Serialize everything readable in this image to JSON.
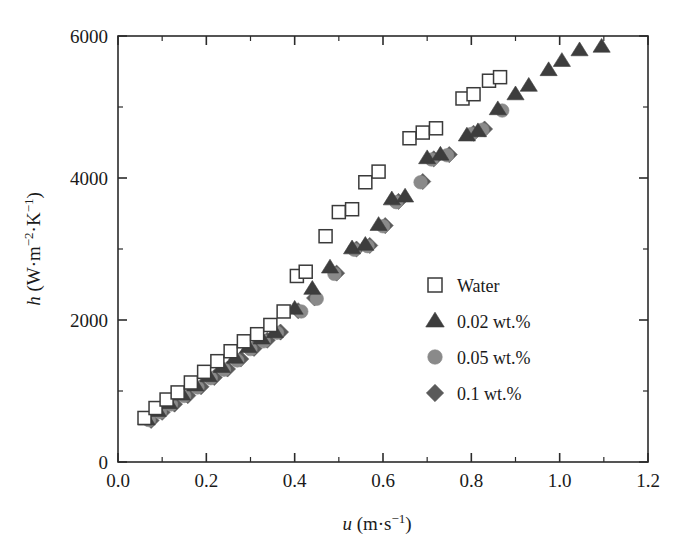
{
  "chart_data": {
    "type": "scatter",
    "title": "",
    "xlabel": "u (m·s−1)",
    "xlabel_symbol": "u",
    "xlabel_units": "(m·s",
    "ylabel": "h (W·m−2·K−1)",
    "ylabel_symbol": "h",
    "xlim": [
      0.0,
      1.2
    ],
    "ylim": [
      0,
      6000
    ],
    "xticks": [
      0.0,
      0.2,
      0.4,
      0.6,
      0.8,
      1.0,
      1.2
    ],
    "xticklabels": [
      "0.0",
      "0.2",
      "0.4",
      "0.6",
      "0.8",
      "1.0",
      "1.2"
    ],
    "xminor_step": 0.1,
    "yticks": [
      0,
      2000,
      4000,
      6000
    ],
    "yticklabels": [
      "0",
      "2000",
      "4000",
      "6000"
    ],
    "yminor_step": 1000,
    "grid": false,
    "legend_position": "center-right",
    "series": [
      {
        "name": "Water",
        "marker": "open-square",
        "fill": "#ffffff",
        "stroke": "#3a3a3a",
        "points": [
          [
            0.06,
            620
          ],
          [
            0.085,
            760
          ],
          [
            0.11,
            880
          ],
          [
            0.135,
            980
          ],
          [
            0.165,
            1120
          ],
          [
            0.195,
            1270
          ],
          [
            0.225,
            1420
          ],
          [
            0.255,
            1560
          ],
          [
            0.285,
            1700
          ],
          [
            0.315,
            1800
          ],
          [
            0.345,
            1930
          ],
          [
            0.375,
            2120
          ],
          [
            0.405,
            2620
          ],
          [
            0.425,
            2680
          ],
          [
            0.47,
            3180
          ],
          [
            0.5,
            3520
          ],
          [
            0.53,
            3560
          ],
          [
            0.56,
            3940
          ],
          [
            0.59,
            4090
          ],
          [
            0.66,
            4560
          ],
          [
            0.69,
            4640
          ],
          [
            0.72,
            4700
          ],
          [
            0.78,
            5120
          ],
          [
            0.805,
            5180
          ],
          [
            0.84,
            5370
          ],
          [
            0.865,
            5420
          ]
        ]
      },
      {
        "name": "0.02 wt.%",
        "marker": "triangle",
        "fill": "#3d3d3d",
        "stroke": "#3d3d3d",
        "points": [
          [
            0.065,
            600
          ],
          [
            0.09,
            720
          ],
          [
            0.115,
            830
          ],
          [
            0.145,
            950
          ],
          [
            0.175,
            1080
          ],
          [
            0.205,
            1210
          ],
          [
            0.235,
            1340
          ],
          [
            0.265,
            1470
          ],
          [
            0.295,
            1620
          ],
          [
            0.325,
            1740
          ],
          [
            0.355,
            1830
          ],
          [
            0.4,
            2160
          ],
          [
            0.44,
            2440
          ],
          [
            0.48,
            2740
          ],
          [
            0.53,
            3010
          ],
          [
            0.56,
            3060
          ],
          [
            0.59,
            3340
          ],
          [
            0.62,
            3700
          ],
          [
            0.65,
            3740
          ],
          [
            0.7,
            4280
          ],
          [
            0.73,
            4330
          ],
          [
            0.79,
            4600
          ],
          [
            0.815,
            4660
          ],
          [
            0.86,
            4970
          ],
          [
            0.9,
            5180
          ],
          [
            0.93,
            5300
          ],
          [
            0.975,
            5520
          ],
          [
            1.005,
            5650
          ],
          [
            1.045,
            5800
          ],
          [
            1.095,
            5850
          ]
        ]
      },
      {
        "name": "0.05 wt.%",
        "marker": "circle",
        "fill": "#8a8a8a",
        "stroke": "#8a8a8a",
        "points": [
          [
            0.07,
            590
          ],
          [
            0.095,
            700
          ],
          [
            0.12,
            810
          ],
          [
            0.15,
            930
          ],
          [
            0.18,
            1050
          ],
          [
            0.21,
            1180
          ],
          [
            0.24,
            1300
          ],
          [
            0.27,
            1430
          ],
          [
            0.3,
            1590
          ],
          [
            0.33,
            1700
          ],
          [
            0.36,
            1820
          ],
          [
            0.415,
            2120
          ],
          [
            0.45,
            2300
          ],
          [
            0.49,
            2650
          ],
          [
            0.535,
            2990
          ],
          [
            0.565,
            3040
          ],
          [
            0.6,
            3320
          ],
          [
            0.63,
            3660
          ],
          [
            0.685,
            3940
          ],
          [
            0.71,
            4260
          ],
          [
            0.745,
            4320
          ],
          [
            0.8,
            4620
          ],
          [
            0.825,
            4680
          ],
          [
            0.87,
            4950
          ]
        ]
      },
      {
        "name": "0.1 wt.%",
        "marker": "diamond",
        "fill": "#5a5a5a",
        "stroke": "#5a5a5a",
        "points": [
          [
            0.075,
            585
          ],
          [
            0.1,
            700
          ],
          [
            0.128,
            815
          ],
          [
            0.158,
            935
          ],
          [
            0.188,
            1060
          ],
          [
            0.218,
            1190
          ],
          [
            0.248,
            1310
          ],
          [
            0.278,
            1450
          ],
          [
            0.308,
            1600
          ],
          [
            0.338,
            1715
          ],
          [
            0.368,
            1830
          ],
          [
            0.408,
            2130
          ],
          [
            0.445,
            2310
          ],
          [
            0.495,
            2660
          ],
          [
            0.54,
            3000
          ],
          [
            0.57,
            3050
          ],
          [
            0.605,
            3330
          ],
          [
            0.635,
            3670
          ],
          [
            0.69,
            3950
          ],
          [
            0.715,
            4270
          ],
          [
            0.75,
            4330
          ],
          [
            0.805,
            4630
          ],
          [
            0.83,
            4690
          ]
        ]
      }
    ]
  },
  "legend": {
    "entries": [
      {
        "label": "Water",
        "marker": "open-square"
      },
      {
        "label": "0.02 wt.%",
        "marker": "triangle"
      },
      {
        "label": "0.05 wt.%",
        "marker": "circle"
      },
      {
        "label": "0.1 wt.%",
        "marker": "diamond"
      }
    ]
  },
  "colors": {
    "axis": "#2b2b2b",
    "water": "#3a3a3a",
    "w002": "#3d3d3d",
    "w005": "#8a8a8a",
    "w01": "#5a5a5a",
    "background": "#ffffff"
  }
}
